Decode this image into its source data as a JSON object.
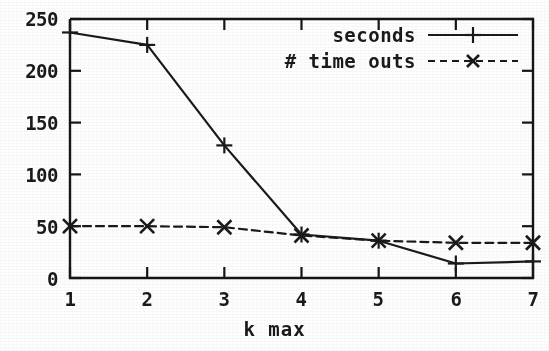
{
  "chart_data": {
    "type": "line",
    "title": "",
    "subtitle": "",
    "xlabel": "k max",
    "ylabel": "",
    "x": [
      1,
      2,
      3,
      4,
      5,
      6,
      7
    ],
    "xticklabels": [
      "1",
      "2",
      "3",
      "4",
      "5",
      "6",
      "7"
    ],
    "yticks": [
      0,
      50,
      100,
      150,
      200,
      250
    ],
    "yticklabels": [
      "0",
      "50",
      "100",
      "150",
      "200",
      "250"
    ],
    "xlim": [
      1,
      7
    ],
    "ylim": [
      0,
      250
    ],
    "grid": false,
    "legend_position": "top-right-inside",
    "series": [
      {
        "name": "seconds",
        "values": [
          237,
          225,
          128,
          42,
          36,
          14,
          16
        ],
        "linestyle": "solid",
        "marker": "plus",
        "color": "#1a1a1a"
      },
      {
        "name": "# time outs",
        "values": [
          50,
          50,
          49,
          41,
          36,
          34,
          34
        ],
        "linestyle": "dashed",
        "marker": "x",
        "color": "#1a1a1a"
      }
    ]
  },
  "legend": {
    "entries": [
      {
        "label": "seconds",
        "sample": "solid-plus-line-sample"
      },
      {
        "label": "# time outs",
        "sample": "dashed-x-line-sample"
      }
    ]
  },
  "axes": {
    "x_title": "k max",
    "x_tick_labels": [
      "1",
      "2",
      "3",
      "4",
      "5",
      "6",
      "7"
    ],
    "y_tick_labels": [
      "0",
      "50",
      "100",
      "150",
      "200",
      "250"
    ]
  },
  "colors": {
    "ink": "#1a1a1a",
    "paper": "#fefefe",
    "frame": "#151515"
  }
}
